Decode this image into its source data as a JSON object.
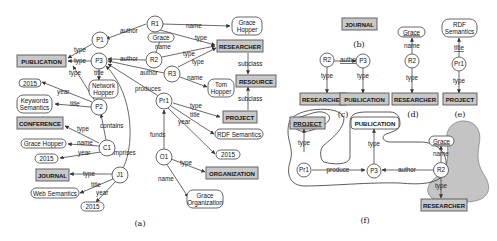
{
  "panels": {
    "a": {
      "caption": "(a)",
      "nodes": {
        "P1": "P1",
        "P2": "P2",
        "P3": "P3",
        "R1": "R1",
        "R2": "R2",
        "R3": "R3",
        "Pr1": "Pr1",
        "C1": "C1",
        "J1": "J1",
        "O1": "O1",
        "publication": "PUBLICATION",
        "conference": "CONFERENCE",
        "journal": "JOURNAL",
        "researcher": "RESEARCHER",
        "resource": "RESOURCE",
        "project": "PROJECT",
        "organization": "ORGANIZATION",
        "grace_hopper_top_1": "Grace",
        "grace_hopper_top_2": "Hopper",
        "grace": "Grace",
        "tom_hopper_1": "Tom",
        "tom_hopper_2": "Hopper",
        "network_hopper_1": "Network",
        "network_hopper_2": "Hopper",
        "year_2015_p2": "2015",
        "keywords_semantics_1": "Keywords",
        "keywords_semantics_2": "Semantics",
        "grace_hopper_c1": "Grace Hopper",
        "year_2015_c1": "2015",
        "web_semantics": "Web Semantics",
        "year_2015_j1": "2015",
        "rdf_semantics": "RDF Semantics",
        "year_2015_pr1": "2015",
        "grace_org_1": "Grace",
        "grace_org_2": "Organization"
      },
      "edges": {
        "author": "author",
        "type": "type",
        "title": "title",
        "year": "year",
        "name": "name",
        "produces": "produces",
        "contains": "contains",
        "comprises": "comprises",
        "funds": "funds",
        "subclass": "subclass"
      }
    },
    "b": {
      "caption": "(b)",
      "node": "JOURNAL"
    },
    "c": {
      "caption": "(c)",
      "nodes": {
        "R2": "R2",
        "P3": "P3",
        "researcher": "RESEARCHER",
        "publication": "PUBLICATION"
      },
      "edges": {
        "author": "author",
        "type": "type"
      }
    },
    "d": {
      "caption": "(d)",
      "nodes": {
        "grace": "Grace",
        "R2": "R2",
        "researcher": "RESEARCHER"
      },
      "edges": {
        "name": "name",
        "type": "type"
      }
    },
    "e": {
      "caption": "(e)",
      "nodes": {
        "rdf_1": "RDF",
        "rdf_2": "Semantics",
        "Pr1": "Pr1",
        "project": "PROJECT"
      },
      "edges": {
        "title": "title",
        "type": "type"
      }
    },
    "f": {
      "caption": "(f)",
      "nodes": {
        "project": "PROJECT",
        "publication": "PUBLICATION",
        "grace": "Grace",
        "Pr1": "Pr1",
        "P3": "P3",
        "R2": "R2",
        "researcher": "RESEARCHER"
      },
      "edges": {
        "type": "type",
        "produce": "produce",
        "author": "author",
        "name": "name"
      }
    }
  }
}
